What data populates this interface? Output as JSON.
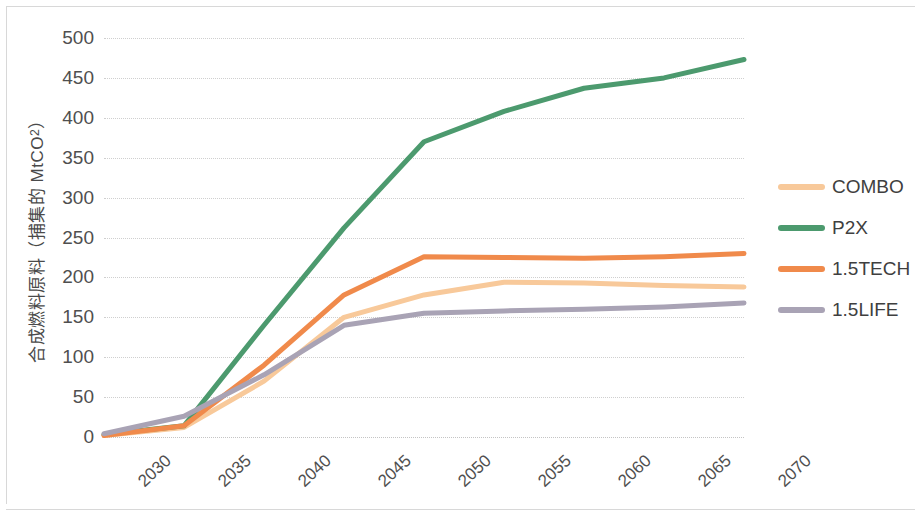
{
  "chart_data": {
    "type": "line",
    "title": "",
    "xlabel": "",
    "ylabel": "合成燃料原料（捕集的 MtCO₂）",
    "ylabel_main": "合成燃料原料（捕集的 MtCO",
    "ylabel_sub": "2",
    "ylabel_tail": "）",
    "x": [
      2030,
      2035,
      2040,
      2045,
      2050,
      2055,
      2060,
      2065,
      2070
    ],
    "categories": [
      "2030",
      "2035",
      "2040",
      "2045",
      "2050",
      "2055",
      "2060",
      "2065",
      "2070"
    ],
    "xlim": [
      2030,
      2070
    ],
    "ylim": [
      0,
      500
    ],
    "yticks": [
      0,
      50,
      100,
      150,
      200,
      250,
      300,
      350,
      400,
      450,
      500
    ],
    "ytick_labels": [
      "0",
      "50",
      "100",
      "150",
      "200",
      "250",
      "300",
      "350",
      "400",
      "450",
      "500"
    ],
    "grid": "horizontal-dotted",
    "legend_position": "right",
    "xtick_rotation_deg": -43,
    "series": [
      {
        "name": "COMBO",
        "color": "#F8C99A",
        "values": [
          2,
          12,
          70,
          150,
          178,
          194,
          193,
          190,
          188
        ]
      },
      {
        "name": "P2X",
        "color": "#4C9A6E",
        "values": [
          3,
          14,
          140,
          262,
          370,
          408,
          437,
          450,
          473
        ]
      },
      {
        "name": "1.5TECH",
        "color": "#F08A4B",
        "values": [
          2,
          14,
          90,
          178,
          226,
          225,
          224,
          226,
          230
        ]
      },
      {
        "name": "1.5LIFE",
        "color": "#A9A3B5",
        "values": [
          4,
          26,
          78,
          140,
          155,
          158,
          160,
          163,
          168
        ]
      }
    ]
  },
  "legend": {
    "items": [
      {
        "label": "COMBO",
        "color": "#F8C99A"
      },
      {
        "label": "P2X",
        "color": "#4C9A6E"
      },
      {
        "label": "1.5TECH",
        "color": "#F08A4B"
      },
      {
        "label": "1.5LIFE",
        "color": "#A9A3B5"
      }
    ]
  }
}
